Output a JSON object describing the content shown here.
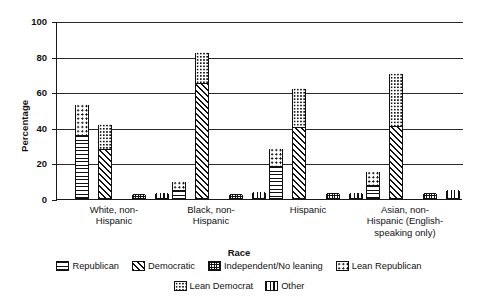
{
  "chart_data": {
    "type": "bar",
    "title": "",
    "xlabel": "Race",
    "ylabel": "Percentage",
    "ylim": [
      0,
      100
    ],
    "yticks": [
      "0",
      "20",
      "40",
      "60",
      "80",
      "100"
    ],
    "grid": true,
    "legend_position": "bottom",
    "stacked": true,
    "categories": [
      "White, non-\nHispanic",
      "Black, non-\nHispanic",
      "Hispanic",
      "Asian, non-\nHispanic (English-\nspeaking only)"
    ],
    "series": [
      {
        "name": "Republican",
        "pattern": "horizontal-lines",
        "values": [
          35,
          4,
          17.5,
          7
        ]
      },
      {
        "name": "Lean Republican",
        "pattern": "large-dots",
        "values": [
          18,
          5.5,
          10.5,
          8
        ]
      },
      {
        "name": "Democratic",
        "pattern": "diagonal-hatch",
        "values": [
          27,
          64,
          39.5,
          40
        ]
      },
      {
        "name": "Lean Democrat",
        "pattern": "small-dots",
        "values": [
          14.5,
          18,
          22.5,
          30.5
        ]
      },
      {
        "name": "Independent/No leaning",
        "pattern": "checker",
        "values": [
          2.5,
          2,
          3,
          3
        ]
      },
      {
        "name": "Other",
        "pattern": "vertical-lines",
        "values": [
          3,
          3.5,
          3,
          4.5
        ]
      }
    ],
    "stack_totals": {
      "republican_total": [
        53,
        9.5,
        28,
        15
      ],
      "democratic_total": [
        41.5,
        82,
        62,
        70.5
      ]
    }
  },
  "legend": {
    "row1": [
      {
        "label": "Republican",
        "pattern": "horizontal-lines"
      },
      {
        "label": "Democratic",
        "pattern": "diagonal-hatch"
      },
      {
        "label": "Independent/No leaning",
        "pattern": "checker"
      },
      {
        "label": "Lean Republican",
        "pattern": "large-dots"
      }
    ],
    "row2": [
      {
        "label": "Lean Democrat",
        "pattern": "small-dots"
      },
      {
        "label": "Other",
        "pattern": "vertical-lines"
      }
    ]
  },
  "ghost_header": {
    "line1": "",
    "mark_a": "",
    "mark_b": ""
  },
  "colors": {
    "ink": "#111111",
    "background": "#ffffff",
    "grid": "#2a2a2a"
  }
}
